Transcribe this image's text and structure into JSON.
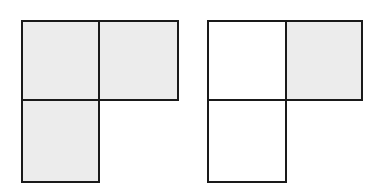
{
  "figures": [
    {
      "name": "left-l-shape",
      "cells": [
        {
          "row": 0,
          "col": 0,
          "shaded": true
        },
        {
          "row": 0,
          "col": 1,
          "shaded": true
        },
        {
          "row": 1,
          "col": 0,
          "shaded": true
        }
      ]
    },
    {
      "name": "right-l-shape",
      "cells": [
        {
          "row": 0,
          "col": 0,
          "shaded": false
        },
        {
          "row": 0,
          "col": 1,
          "shaded": true
        },
        {
          "row": 1,
          "col": 0,
          "shaded": false
        }
      ]
    }
  ],
  "colors": {
    "shade": "#ececec",
    "stroke": "#1a1a1a",
    "background": "#ffffff"
  }
}
